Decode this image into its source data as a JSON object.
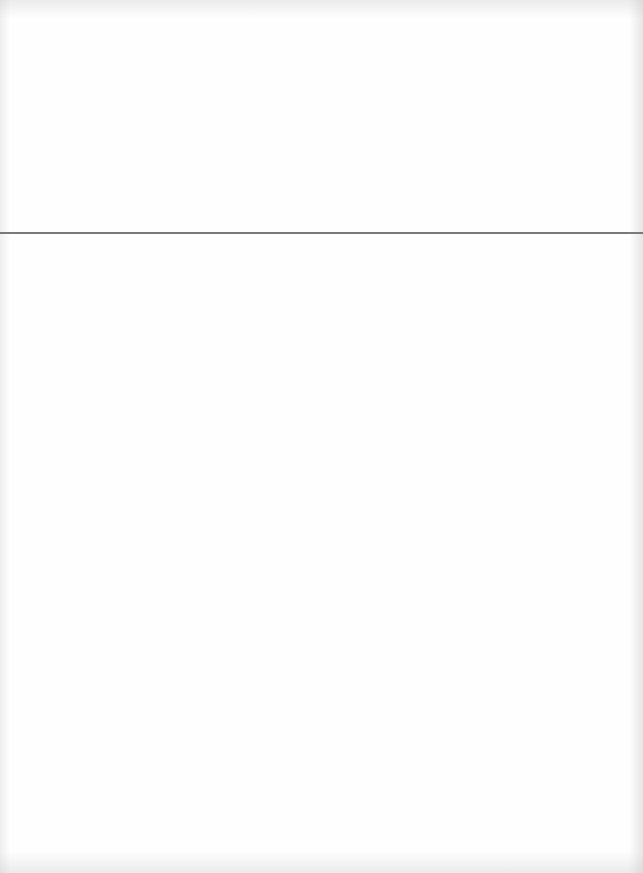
{
  "page": {
    "type": "blank-scanned-page",
    "background_color": "#fefefe",
    "rule": {
      "orientation": "horizontal",
      "y": 233,
      "color": "#7a7a7a"
    },
    "text_content": ""
  }
}
